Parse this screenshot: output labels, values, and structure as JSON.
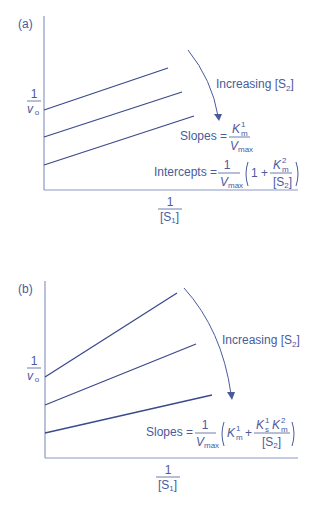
{
  "panel_a": {
    "label": "(a)",
    "y_axis_label": {
      "num": "1",
      "den": "v",
      "den_sub": "o"
    },
    "x_axis_label": {
      "num": "1",
      "den_open": "[S",
      "den_sub": "1",
      "den_close": "]"
    },
    "arrow_label": {
      "text": "Increasing [S",
      "sub": "2",
      "close": "]"
    },
    "slopes": {
      "prefix": "Slopes =",
      "num_K": "K",
      "num_sup": "1",
      "num_sub": "m",
      "den_V": "V",
      "den_sub": "max"
    },
    "intercepts": {
      "prefix": "Intercepts =",
      "num": "1",
      "den_V": "V",
      "den_sub": "max",
      "one_plus": "1 +",
      "K": "K",
      "K_sup": "2",
      "K_sub": "m",
      "S_open": "[S",
      "S_sub": "2",
      "S_close": "]"
    },
    "lines_count": 3
  },
  "panel_b": {
    "label": "(b)",
    "y_axis_label": {
      "num": "1",
      "den": "v",
      "den_sub": "o"
    },
    "x_axis_label": {
      "num": "1",
      "den_open": "[S",
      "den_sub": "1",
      "den_close": "]"
    },
    "arrow_label": {
      "text": "Increasing [S",
      "sub": "2",
      "close": "]"
    },
    "slopes": {
      "prefix": "Slopes =",
      "num": "1",
      "den_V": "V",
      "den_sub": "max",
      "K1": "K",
      "K1_sup": "1",
      "K1_sub": "m",
      "plus": "+",
      "Ks": "K",
      "Ks_sup": "1",
      "Ks_sub": "s",
      "Km": "K",
      "Km_sup": "2",
      "Km_sub": "m",
      "S_open": "[S",
      "S_sub": "2",
      "S_close": "]"
    },
    "lines_count": 3
  },
  "colors": {
    "text": "#4a5a9c",
    "lines": "#3b4a8a",
    "axes": "#8c98c4"
  }
}
